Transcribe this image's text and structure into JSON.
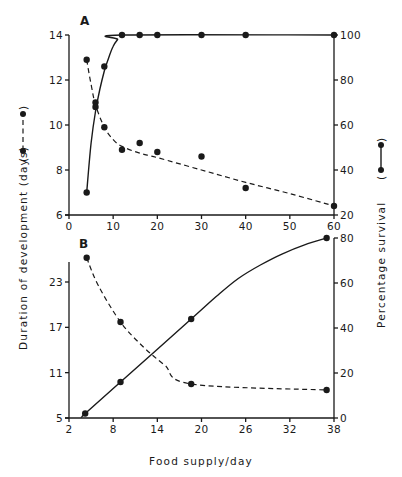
{
  "figure": {
    "y_axis_left_title": "Duration of development (days)",
    "y_axis_right_title": "Percentage survival",
    "x_axis_title": "Food supply/day",
    "legend_left": "dashed line with dots",
    "legend_right": "solid line with dots"
  },
  "chart_data": [
    {
      "type": "line",
      "panel": "A",
      "title": "A",
      "xlabel": "Food supply/day",
      "ylabel_left": "Duration of development (days)",
      "ylabel_right": "Percentage survival",
      "xlim": [
        0,
        60
      ],
      "xticks": [
        0,
        10,
        20,
        30,
        40,
        50,
        60
      ],
      "ylim_left": [
        6,
        14
      ],
      "yticks_left": [
        6,
        8,
        10,
        12,
        14
      ],
      "ylim_right": [
        20,
        100
      ],
      "yticks_right": [
        20,
        40,
        60,
        80,
        100
      ],
      "grid": false,
      "series": [
        {
          "name": "Duration of development (days)",
          "axis": "left",
          "style": "dashed",
          "points": [
            [
              4,
              12.9
            ],
            [
              6,
              11.0
            ],
            [
              8,
              9.9
            ],
            [
              12,
              8.9
            ],
            [
              16,
              9.2
            ],
            [
              20,
              8.8
            ],
            [
              30,
              8.6
            ],
            [
              40,
              7.2
            ],
            [
              60,
              6.4
            ]
          ],
          "curve": [
            [
              4,
              12.9
            ],
            [
              5,
              11.8
            ],
            [
              6,
              10.9
            ],
            [
              8,
              9.9
            ],
            [
              10,
              9.35
            ],
            [
              12,
              9.05
            ],
            [
              16,
              8.75
            ],
            [
              20,
              8.55
            ],
            [
              30,
              8.0
            ],
            [
              40,
              7.45
            ],
            [
              50,
              6.95
            ],
            [
              60,
              6.4
            ]
          ]
        },
        {
          "name": "Percentage survival",
          "axis": "right",
          "style": "solid",
          "points": [
            [
              4,
              30
            ],
            [
              6,
              68
            ],
            [
              8,
              86
            ],
            [
              12,
              100
            ],
            [
              16,
              100
            ],
            [
              20,
              100
            ],
            [
              30,
              100
            ],
            [
              40,
              100
            ],
            [
              60,
              100
            ]
          ],
          "curve": [
            [
              4,
              30
            ],
            [
              5,
              52
            ],
            [
              6,
              66
            ],
            [
              7,
              76
            ],
            [
              8,
              84
            ],
            [
              9,
              90
            ],
            [
              10,
              95
            ],
            [
              11,
              98
            ],
            [
              12,
              100
            ],
            [
              60,
              100
            ]
          ]
        }
      ]
    },
    {
      "type": "line",
      "panel": "B",
      "title": "B",
      "xlabel": "Food supply/day",
      "ylabel_left": "Duration of development (days)",
      "ylabel_right": "Percentage survival",
      "xlim": [
        2,
        38
      ],
      "xticks": [
        2,
        8,
        14,
        20,
        26,
        32,
        38
      ],
      "ylim_left": [
        5,
        28
      ],
      "yticks_left": [
        5,
        11,
        17,
        23
      ],
      "ylim_right": [
        0,
        80
      ],
      "yticks_right": [
        0,
        20,
        40,
        60,
        80
      ],
      "grid": false,
      "series": [
        {
          "name": "Duration of development (days)",
          "axis": "left",
          "style": "dashed",
          "points": [
            [
              4.4,
              26.2
            ],
            [
              9,
              17.7
            ],
            [
              18.6,
              9.5
            ],
            [
              37,
              8.7
            ]
          ],
          "curve": [
            [
              4.4,
              26.2
            ],
            [
              6,
              22.5
            ],
            [
              9,
              17.7
            ],
            [
              12,
              14.5
            ],
            [
              15,
              12.0
            ],
            [
              18.6,
              9.5
            ],
            [
              37,
              8.7
            ]
          ]
        },
        {
          "name": "Percentage survival",
          "axis": "right",
          "style": "solid",
          "points": [
            [
              4.2,
              2
            ],
            [
              9,
              16
            ],
            [
              18.6,
              44
            ],
            [
              37,
              80
            ]
          ],
          "curve": [
            [
              3.8,
              0.5
            ],
            [
              4.2,
              2
            ],
            [
              9,
              16
            ],
            [
              18.6,
              44
            ],
            [
              22,
              54
            ],
            [
              25,
              62
            ],
            [
              28,
              68
            ],
            [
              31,
              73
            ],
            [
              34,
              77
            ],
            [
              37,
              80
            ]
          ]
        }
      ]
    }
  ]
}
